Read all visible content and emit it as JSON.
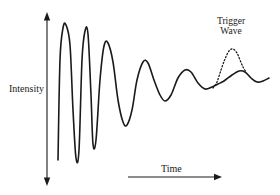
{
  "figure": {
    "background_color": "#ffffff",
    "stroke_color": "#1a1a1a"
  },
  "axes": {
    "y": {
      "label": "Intensity",
      "icon": "double-headed-vertical-arrow",
      "x": 47,
      "y_top": 12,
      "y_bottom": 186
    },
    "x": {
      "label": "Time",
      "icon": "right-arrow",
      "y": 177,
      "x_start": 128,
      "x_end": 222
    }
  },
  "annotations": {
    "trigger": {
      "line1": "Trigger",
      "line2": "Wave"
    }
  },
  "chart_data": {
    "type": "line",
    "title": "",
    "xlabel": "Time",
    "ylabel": "Intensity",
    "grid": false,
    "legend": false,
    "series": [
      {
        "name": "damped-oscillation",
        "style": "solid",
        "points": [
          [
            58,
            160
          ],
          [
            60,
            60
          ],
          [
            63,
            28
          ],
          [
            66,
            25
          ],
          [
            70,
            45
          ],
          [
            73,
            110
          ],
          [
            76,
            158
          ],
          [
            79,
            150
          ],
          [
            82,
            60
          ],
          [
            85,
            31
          ],
          [
            88,
            34
          ],
          [
            91,
            95
          ],
          [
            93,
            144
          ],
          [
            96,
            140
          ],
          [
            100,
            80
          ],
          [
            104,
            46
          ],
          [
            108,
            43
          ],
          [
            113,
            62
          ],
          [
            118,
            100
          ],
          [
            123,
            122
          ],
          [
            127,
            125
          ],
          [
            132,
            110
          ],
          [
            137,
            80
          ],
          [
            143,
            62
          ],
          [
            148,
            63
          ],
          [
            154,
            80
          ],
          [
            160,
            95
          ],
          [
            165,
            101
          ],
          [
            171,
            95
          ],
          [
            178,
            78
          ],
          [
            185,
            70
          ],
          [
            191,
            72
          ],
          [
            198,
            83
          ],
          [
            205,
            89
          ],
          [
            212,
            87
          ],
          [
            218,
            84
          ],
          [
            224,
            81
          ],
          [
            232,
            75
          ],
          [
            239,
            71
          ],
          [
            245,
            72
          ],
          [
            251,
            78
          ],
          [
            257,
            82
          ],
          [
            263,
            81
          ],
          [
            269,
            78
          ]
        ]
      },
      {
        "name": "trigger-wave",
        "style": "dotted",
        "points": [
          [
            213,
            88
          ],
          [
            217,
            82
          ],
          [
            221,
            70
          ],
          [
            225,
            59
          ],
          [
            229,
            51
          ],
          [
            233,
            49
          ],
          [
            237,
            53
          ],
          [
            240,
            60
          ],
          [
            243,
            67
          ],
          [
            246,
            72
          ]
        ]
      }
    ]
  }
}
